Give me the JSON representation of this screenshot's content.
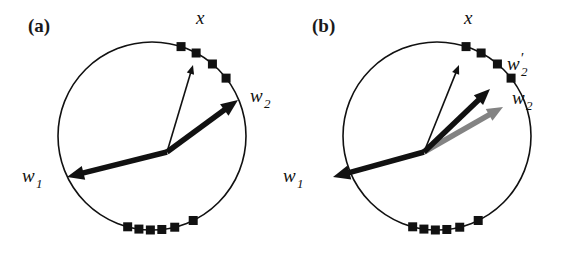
{
  "figure": {
    "background_color": "#ffffff",
    "stroke_color": "#111111",
    "gray_arrow_color": "#838383",
    "panels": [
      {
        "id": "a",
        "panel_label": "(a)",
        "panel_label_pos": [
          28,
          32
        ],
        "circle": {
          "cx": 152,
          "cy": 136,
          "r": 94,
          "stroke_width": 1.6
        },
        "origin": [
          167,
          152
        ],
        "markers": {
          "size": 9,
          "cluster_upper_right_count": 4,
          "cluster_bottom_count": 6,
          "upper_right_angles_deg": [
            72,
            62,
            50,
            38
          ],
          "bottom_angles_deg": [
            255,
            262,
            269,
            276,
            284,
            296
          ]
        },
        "vectors": [
          {
            "name": "x",
            "label": "x",
            "label_pos": [
              196,
              24
            ],
            "style": "thin-black",
            "tip": [
              193,
              65
            ],
            "width": 1.6,
            "head_size": 9
          },
          {
            "name": "w1",
            "label": "w",
            "subscript": "1",
            "label_pos": [
              22,
              182
            ],
            "style": "thick-black",
            "tip": [
              67,
              177
            ],
            "width": 5.5,
            "head_size": 17
          },
          {
            "name": "w2",
            "label": "w",
            "subscript": "2",
            "label_pos": [
              250,
              102
            ],
            "style": "thick-black",
            "tip": [
              238,
              100
            ],
            "width": 5.5,
            "head_size": 17
          }
        ]
      },
      {
        "id": "b",
        "panel_label": "(b)",
        "panel_label_pos": [
          312,
          32
        ],
        "circle": {
          "cx": 437,
          "cy": 136,
          "r": 94,
          "stroke_width": 1.6
        },
        "origin": [
          424,
          152
        ],
        "markers": {
          "size": 9,
          "cluster_upper_right_count": 4,
          "cluster_bottom_count": 6,
          "upper_right_angles_deg": [
            72,
            62,
            50,
            38
          ],
          "bottom_angles_deg": [
            255,
            262,
            269,
            276,
            284,
            296
          ]
        },
        "vectors": [
          {
            "name": "x",
            "label": "x",
            "label_pos": [
              464,
              24
            ],
            "style": "thin-black",
            "tip": [
              459,
              65
            ],
            "width": 1.6,
            "head_size": 9
          },
          {
            "name": "w1",
            "label": "w",
            "subscript": "1",
            "label_pos": [
              283,
              182
            ],
            "style": "thick-black",
            "tip": [
              333,
              177
            ],
            "width": 5.5,
            "head_size": 17
          },
          {
            "name": "w2prime",
            "label": "w",
            "subscript": "2",
            "prime": true,
            "label_pos": [
              507,
              70
            ],
            "style": "thick-black",
            "tip": [
              490,
              89
            ],
            "width": 5.5,
            "head_size": 16
          },
          {
            "name": "w2",
            "label": "w",
            "subscript": "2",
            "label_pos": [
              512,
              104
            ],
            "style": "thick-gray",
            "tip": [
              503,
              107
            ],
            "width": 5.5,
            "head_size": 16
          }
        ]
      }
    ]
  }
}
